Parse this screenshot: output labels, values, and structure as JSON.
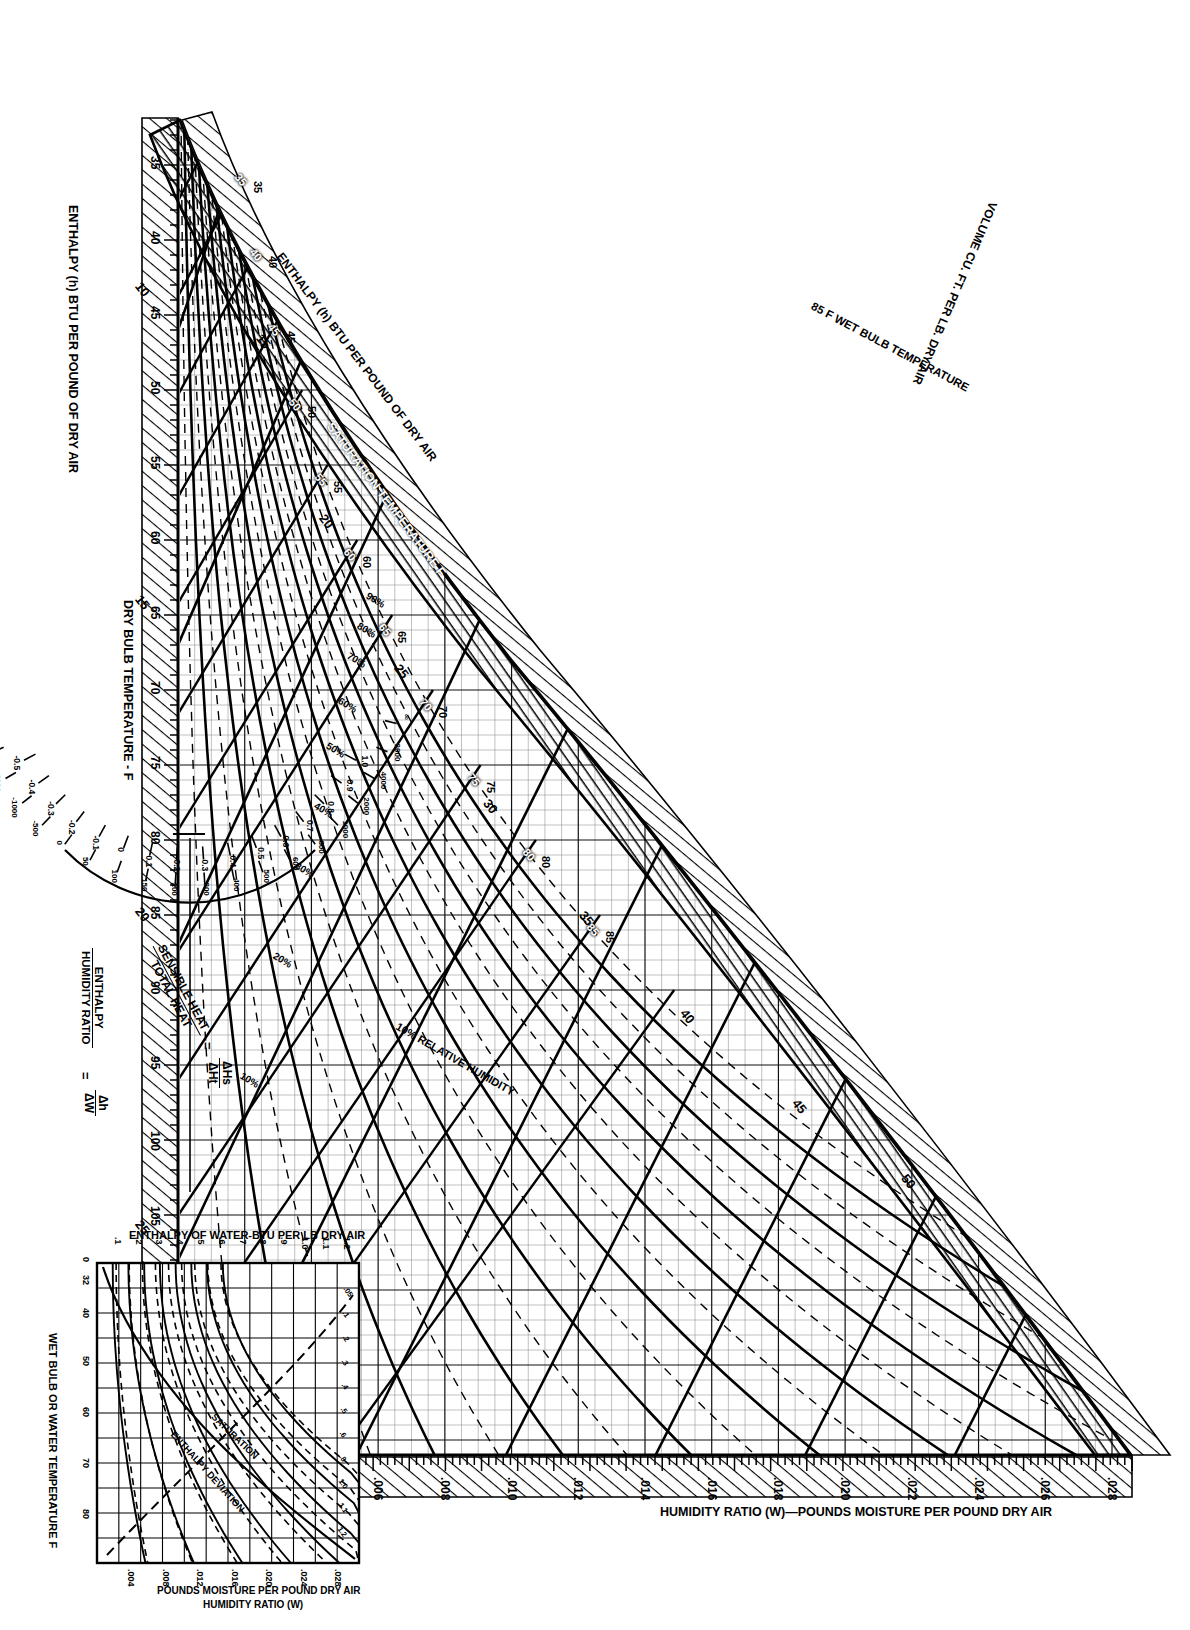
{
  "chart": {
    "kind": "psychrometric-chart",
    "orientation_note": "sheet printed rotated 90 degrees",
    "axis_titles": {
      "dry_bulb": "DRY BULB TEMPERATURE - F",
      "humidity_ratio": "HUMIDITY RATIO (W)—POUNDS MOISTURE PER POUND DRY AIR",
      "enthalpy_outer": "ENTHALPY (h) BTU PER POUND OF DRY AIR",
      "enthalpy_diag": "ENTHALPY (h) BTU PER POUND OF DRY AIR",
      "saturation_temp": "SATURATION TEMPERATURE F",
      "volume": "VOLUME CU. FT. PER LB. DRY AIR",
      "wet_bulb_example": "85 F WET BULB TEMPERATURE",
      "rh_example": "10% RELATIVE HUMIDITY"
    },
    "dry_bulb_ticks": [
      35,
      40,
      45,
      50,
      55,
      60,
      65,
      70,
      75,
      80,
      85,
      90,
      95,
      100,
      105,
      110,
      115,
      120
    ],
    "humidity_ratio_ticks": [
      ".002",
      ".004",
      ".006",
      ".008",
      ".010",
      ".012",
      ".014",
      ".016",
      ".018",
      ".020",
      ".022",
      ".024",
      ".026",
      ".028"
    ],
    "enthalpy_right_ticks": [
      10,
      15,
      20,
      25,
      30
    ],
    "enthalpy_diag_ticks": [
      15,
      20,
      25,
      30,
      35,
      40,
      45,
      50
    ],
    "saturation_temp_ticks": [
      35,
      40,
      45,
      50,
      55,
      60,
      65,
      70,
      75,
      80,
      85
    ],
    "wet_bulb_labels": [
      35,
      40,
      45,
      50,
      55,
      60,
      65,
      70,
      75,
      80,
      85
    ],
    "relative_humidity_labels": [
      "10%",
      "20%",
      "30%",
      "40%",
      "50%",
      "60%",
      "70%",
      "80%",
      "90%"
    ],
    "volume_labels": [
      "13.0",
      "13.5",
      "14.0",
      "14.5",
      "15.0"
    ],
    "wet_bulb_named": "85 F WET BULB TEMPERATURE",
    "rh_named": "10% RELATIVE HUMIDITY"
  },
  "chart_data": {
    "type": "line",
    "xlabel": "DRY BULB TEMPERATURE - F",
    "ylabel": "HUMIDITY RATIO (W)—POUNDS MOISTURE PER POUND DRY AIR",
    "xlim": [
      32,
      120
    ],
    "ylim": [
      0,
      0.028
    ],
    "grid": true,
    "legend": "none",
    "x_ticks": [
      35,
      40,
      45,
      50,
      55,
      60,
      65,
      70,
      75,
      80,
      85,
      90,
      95,
      100,
      105,
      110,
      115,
      120
    ],
    "y_ticks": [
      0.002,
      0.004,
      0.006,
      0.008,
      0.01,
      0.012,
      0.014,
      0.016,
      0.018,
      0.02,
      0.022,
      0.024,
      0.026,
      0.028
    ],
    "secondary_axes": [
      {
        "name": "ENTHALPY (h) BTU PER POUND OF DRY AIR",
        "ticks": [
          10,
          15,
          20,
          25,
          30,
          35,
          40,
          45,
          50,
          55
        ]
      },
      {
        "name": "SATURATION TEMPERATURE F",
        "ticks": [
          35,
          40,
          45,
          50,
          55,
          60,
          65,
          70,
          75,
          80,
          85
        ]
      },
      {
        "name": "WET BULB TEMPERATURE F",
        "ticks": [
          30,
          35,
          40,
          45,
          50,
          55,
          60,
          65,
          70,
          75,
          80,
          85
        ]
      }
    ],
    "series": [
      {
        "name": "Saturation (100% RH)",
        "kind": "saturation-curve",
        "x": [
          32,
          40,
          50,
          60,
          70,
          80,
          90,
          100,
          110,
          120
        ],
        "values": [
          0.0038,
          0.0052,
          0.0076,
          0.0111,
          0.0158,
          0.0223,
          0.0312,
          0.0432,
          0.06,
          0.0817
        ]
      },
      {
        "name": "10% RH",
        "values": [
          0.0004,
          0.0005,
          0.0008,
          0.0011,
          0.0016,
          0.0022,
          0.0031,
          0.0043,
          0.006,
          0.0082
        ]
      },
      {
        "name": "20% RH",
        "values": [
          0.0008,
          0.001,
          0.0015,
          0.0022,
          0.0032,
          0.0045,
          0.0062,
          0.0086,
          0.012,
          0.0163
        ]
      },
      {
        "name": "30% RH",
        "values": [
          0.0011,
          0.0016,
          0.0023,
          0.0033,
          0.0047,
          0.0067,
          0.0094,
          0.013,
          0.018,
          0.0245
        ]
      },
      {
        "name": "40% RH",
        "values": [
          0.0015,
          0.0021,
          0.003,
          0.0044,
          0.0063,
          0.0089,
          0.0125,
          0.0173,
          0.024,
          0.0327
        ]
      },
      {
        "name": "50% RH",
        "values": [
          0.0019,
          0.0026,
          0.0038,
          0.0056,
          0.0079,
          0.0112,
          0.0156,
          0.0216,
          0.03,
          0.0409
        ]
      },
      {
        "name": "60% RH",
        "values": [
          0.0023,
          0.0031,
          0.0046,
          0.0067,
          0.0095,
          0.0134,
          0.0187,
          0.0259,
          0.036,
          0.049
        ]
      },
      {
        "name": "70% RH",
        "values": [
          0.0027,
          0.0036,
          0.0053,
          0.0078,
          0.0111,
          0.0156,
          0.0218,
          0.0302,
          0.042,
          0.0572
        ]
      },
      {
        "name": "80% RH",
        "values": [
          0.003,
          0.0042,
          0.0061,
          0.0089,
          0.0126,
          0.0178,
          0.025,
          0.0346,
          0.048,
          0.0654
        ]
      },
      {
        "name": "90% RH",
        "values": [
          0.0034,
          0.0047,
          0.0068,
          0.01,
          0.0142,
          0.0201,
          0.0281,
          0.0389,
          0.054,
          0.0735
        ]
      }
    ],
    "volume_lines_cuft_per_lb": [
      13.0,
      13.5,
      14.0,
      14.5,
      15.0
    ],
    "enthalpy_lines_btu_per_lb": [
      10,
      15,
      20,
      25,
      30,
      35,
      40,
      45,
      50,
      55
    ],
    "annotations": [
      "VOLUME CU. FT. PER LB. DRY AIR",
      "85 F WET BULB TEMPERATURE",
      "10% RELATIVE HUMIDITY",
      "SATURATION TEMPERATURE",
      "ENTHALPY (h) BTU PER POUND OF DRY AIR"
    ]
  },
  "protractor": {
    "label_top": "SENSIBLE HEAT",
    "label_bottom": "TOTAL HEAT",
    "equals": "=",
    "ratio_num": "ΔHs",
    "ratio_den": "ΔHt",
    "alt_label_top": "ENTHALPY",
    "alt_label_bottom": "HUMIDITY RATIO",
    "alt_equals": "=",
    "alt_ratio_num": "Δh",
    "alt_ratio_den": "ΔW",
    "inner_scale": [
      "1.0",
      "0.9",
      "0.8",
      "0.7",
      "0.6",
      "0.5",
      "0.4",
      "0.3",
      "0.2",
      "0.1",
      "0",
      "-0.1",
      "-0.2",
      "-0.3",
      "-0.4",
      "-0.5"
    ],
    "outer_scale": [
      "∞",
      "8000",
      "4000",
      "2000",
      "1000",
      "800",
      "600",
      "500",
      "400",
      "300",
      "200",
      "150",
      "100",
      "50",
      "0",
      "-500",
      "-1000",
      "-2000",
      "-4000",
      "-8000"
    ]
  },
  "inset": {
    "title_y": "ENTHALPY OF WATER-BTU PER LB DRY AIR",
    "title_x": "WET BULB OR WATER TEMPERATURE F",
    "title_humidity": "HUMIDITY RATIO (W)",
    "title_humidity2": "POUNDS MOISTURE PER POUND DRY AIR",
    "y_ticks": [
      ".1",
      ".2",
      ".3",
      ".4",
      ".5",
      ".6",
      ".7",
      ".8",
      ".9",
      "1.0",
      "1.1",
      "1.2"
    ],
    "x_ticks": [
      "0",
      "32",
      "40",
      "50",
      "60",
      "70",
      "80"
    ],
    "humidity_ticks": [
      ".004",
      ".008",
      ".012",
      ".016",
      ".020",
      ".024",
      ".028"
    ],
    "curve_label_saturation": "SATURATION",
    "curve_label_deviation": "ENTHALPY DEVIATION",
    "deviation_values": [
      ".05",
      ".1",
      ".2",
      ".3",
      ".4",
      ".5",
      ".6",
      ".8",
      "1.0",
      "1.1",
      "1.2"
    ]
  },
  "colors": {
    "ink": "#000000",
    "paper": "#ffffff",
    "grid_light": "#7a7a7a",
    "grid_mid": "#4a4a4a"
  }
}
